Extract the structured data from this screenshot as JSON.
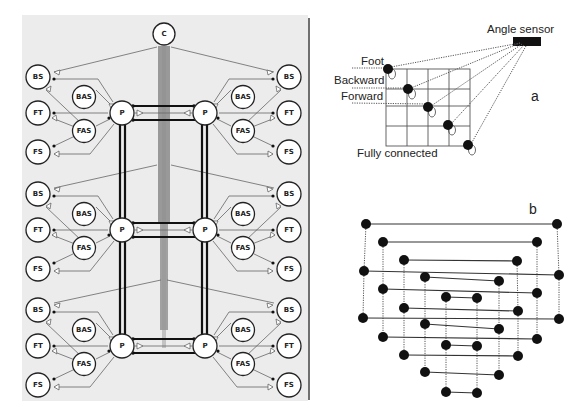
{
  "panel_left": {
    "central_node": "C",
    "pattern_generator_label": "P",
    "segments": [
      {
        "row": 1,
        "left": [
          "BS",
          "BAS",
          "FT",
          "FAS",
          "FS"
        ],
        "right": [
          "BS",
          "BAS",
          "FT",
          "FAS",
          "FS"
        ]
      },
      {
        "row": 2,
        "left": [
          "BS",
          "BAS",
          "FT",
          "FAS",
          "FS"
        ],
        "right": [
          "BS",
          "BAS",
          "FT",
          "FAS",
          "FS"
        ]
      },
      {
        "row": 3,
        "left": [
          "BS",
          "BAS",
          "FT",
          "FAS",
          "FS"
        ],
        "right": [
          "BS",
          "BAS",
          "FT",
          "FAS",
          "FS"
        ]
      }
    ],
    "labels": {
      "C": "C",
      "P": "P",
      "BS": "BS",
      "BAS": "BAS",
      "FT": "FT",
      "FAS": "FAS",
      "FS": "FS"
    }
  },
  "panel_a": {
    "tag": "a",
    "sensor_label": "Angle sensor",
    "labels": {
      "foot": "Foot",
      "backward": "Backward",
      "forward": "Forward",
      "fully_connected": "Fully connected"
    }
  },
  "panel_b": {
    "tag": "b"
  }
}
